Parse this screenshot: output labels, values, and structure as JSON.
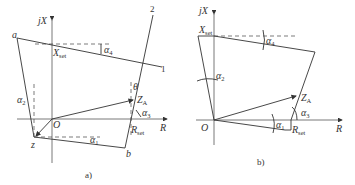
{
  "figure_a": {
    "caption": "a)",
    "axis_y_label": "jX",
    "axis_x_label": "R",
    "origin_label": "O",
    "point_a": "a",
    "point_b": "b",
    "point_z": "z",
    "x_set_label": "X",
    "x_set_sub": "set",
    "r_set_label": "R",
    "r_set_sub": "set",
    "z_a_label": "Z",
    "z_a_sub": "A",
    "line1_label": "1",
    "line2_label": "2",
    "theta": "θ",
    "alpha1": "α",
    "alpha1_sub": "1",
    "alpha2": "α",
    "alpha2_sub": "2",
    "alpha3": "α",
    "alpha3_sub": "3",
    "alpha4": "α",
    "alpha4_sub": "4"
  },
  "figure_b": {
    "caption": "b)",
    "axis_y_label": "jX",
    "axis_x_label": "R",
    "origin_label": "O",
    "x_set_label": "X",
    "x_set_sub": "set",
    "r_set_label": "R",
    "r_set_sub": "set",
    "z_a_label": "Z",
    "z_a_sub": "A",
    "alpha1": "α",
    "alpha1_sub": "1",
    "alpha2": "α",
    "alpha2_sub": "2",
    "alpha3": "α",
    "alpha3_sub": "3",
    "alpha4": "α",
    "alpha4_sub": "4"
  }
}
